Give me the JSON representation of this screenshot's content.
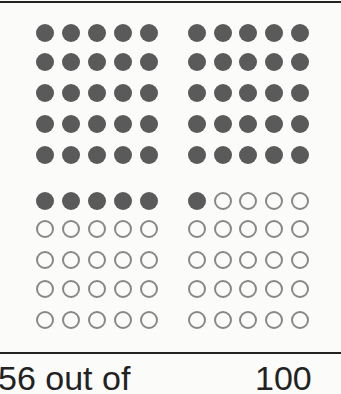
{
  "chart_data": {
    "type": "waffle",
    "title": "",
    "total": 100,
    "filled": 56,
    "empty": 44,
    "grid": {
      "rows": 10,
      "cols": 10,
      "blocks": "2x2 blocks of 5x5"
    },
    "colors": {
      "filled": "#5a5a5a",
      "empty_outline": "#888888"
    },
    "caption_left": "56 out of",
    "caption_right": "100"
  }
}
